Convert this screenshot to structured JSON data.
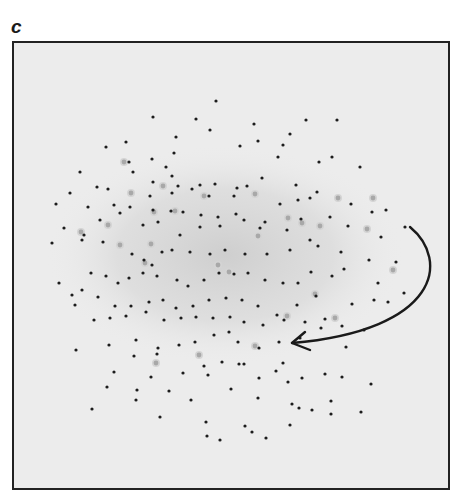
{
  "figure": {
    "panel_label": "c",
    "frame": {
      "x": 12,
      "y": 41,
      "width": 438,
      "height": 449
    },
    "colors": {
      "background": "#ececec",
      "frame": "#222222",
      "dot": "#1c1c1c",
      "faint_spot": "#9a9a9a",
      "halo": "#d4d4d4",
      "arrow": "#1a1a1a"
    },
    "arrow": {
      "description": "curved arrow from right edge of dot cloud sweeping down-left",
      "start": [
        410,
        227
      ],
      "control1": [
        450,
        260
      ],
      "control2": [
        440,
        330
      ],
      "end": [
        292,
        343
      ],
      "head": [
        [
          305,
          332
        ],
        [
          292,
          343
        ],
        [
          310,
          350
        ]
      ]
    }
  },
  "chart_data": {
    "type": "scatter",
    "title": "",
    "panel": "c",
    "xlabel": "",
    "ylabel": "",
    "grid": false,
    "legend": null,
    "annotations": [
      "curved arrow indicating rotation direction around cloud edge, ending near (292,343)"
    ],
    "series": [
      {
        "name": "dark-dots",
        "points": [
          [
            216,
            101
          ],
          [
            153,
            117
          ],
          [
            196,
            119
          ],
          [
            254,
            124
          ],
          [
            306,
            120
          ],
          [
            337,
            120
          ],
          [
            106,
            147
          ],
          [
            126,
            142
          ],
          [
            176,
            137
          ],
          [
            210,
            130
          ],
          [
            240,
            146
          ],
          [
            258,
            141
          ],
          [
            283,
            145
          ],
          [
            80,
            172
          ],
          [
            129,
            162
          ],
          [
            152,
            159
          ],
          [
            166,
            167
          ],
          [
            174,
            153
          ],
          [
            278,
            157
          ],
          [
            290,
            134
          ],
          [
            319,
            162
          ],
          [
            332,
            157
          ],
          [
            360,
            167
          ],
          [
            97,
            187
          ],
          [
            108,
            189
          ],
          [
            133,
            172
          ],
          [
            153,
            182
          ],
          [
            172,
            176
          ],
          [
            178,
            186
          ],
          [
            200,
            185
          ],
          [
            215,
            184
          ],
          [
            237,
            188
          ],
          [
            247,
            186
          ],
          [
            296,
            185
          ],
          [
            317,
            192
          ],
          [
            70,
            193
          ],
          [
            114,
            205
          ],
          [
            150,
            196
          ],
          [
            172,
            193
          ],
          [
            192,
            189
          ],
          [
            209,
            196
          ],
          [
            234,
            196
          ],
          [
            262,
            178
          ],
          [
            280,
            204
          ],
          [
            298,
            200
          ],
          [
            310,
            198
          ],
          [
            351,
            204
          ],
          [
            386,
            210
          ],
          [
            56,
            204
          ],
          [
            88,
            207
          ],
          [
            130,
            207
          ],
          [
            153,
            210
          ],
          [
            183,
            212
          ],
          [
            201,
            215
          ],
          [
            218,
            217
          ],
          [
            236,
            214
          ],
          [
            265,
            222
          ],
          [
            301,
            219
          ],
          [
            330,
            217
          ],
          [
            372,
            212
          ],
          [
            405,
            227
          ],
          [
            52,
            243
          ],
          [
            64,
            228
          ],
          [
            84,
            235
          ],
          [
            100,
            220
          ],
          [
            120,
            213
          ],
          [
            143,
            225
          ],
          [
            158,
            222
          ],
          [
            171,
            211
          ],
          [
            180,
            235
          ],
          [
            200,
            227
          ],
          [
            220,
            226
          ],
          [
            244,
            220
          ],
          [
            260,
            228
          ],
          [
            287,
            230
          ],
          [
            310,
            240
          ],
          [
            348,
            226
          ],
          [
            381,
            237
          ],
          [
            59,
            283
          ],
          [
            82,
            240
          ],
          [
            103,
            242
          ],
          [
            132,
            254
          ],
          [
            144,
            260
          ],
          [
            152,
            265
          ],
          [
            162,
            252
          ],
          [
            172,
            250
          ],
          [
            190,
            252
          ],
          [
            210,
            254
          ],
          [
            225,
            250
          ],
          [
            245,
            254
          ],
          [
            267,
            254
          ],
          [
            290,
            250
          ],
          [
            318,
            246
          ],
          [
            341,
            252
          ],
          [
            369,
            260
          ],
          [
            72,
            295
          ],
          [
            91,
            273
          ],
          [
            106,
            276
          ],
          [
            118,
            283
          ],
          [
            129,
            278
          ],
          [
            143,
            273
          ],
          [
            157,
            276
          ],
          [
            177,
            280
          ],
          [
            188,
            286
          ],
          [
            204,
            280
          ],
          [
            219,
            273
          ],
          [
            234,
            274
          ],
          [
            248,
            273
          ],
          [
            265,
            280
          ],
          [
            283,
            283
          ],
          [
            298,
            283
          ],
          [
            311,
            272
          ],
          [
            332,
            276
          ],
          [
            344,
            269
          ],
          [
            378,
            283
          ],
          [
            396,
            262
          ],
          [
            404,
            293
          ],
          [
            75,
            305
          ],
          [
            82,
            290
          ],
          [
            98,
            297
          ],
          [
            115,
            306
          ],
          [
            131,
            306
          ],
          [
            149,
            302
          ],
          [
            163,
            300
          ],
          [
            176,
            308
          ],
          [
            193,
            306
          ],
          [
            209,
            300
          ],
          [
            226,
            298
          ],
          [
            242,
            300
          ],
          [
            258,
            306
          ],
          [
            277,
            315
          ],
          [
            297,
            305
          ],
          [
            316,
            296
          ],
          [
            352,
            304
          ],
          [
            374,
            300
          ],
          [
            388,
            302
          ],
          [
            94,
            320
          ],
          [
            110,
            318
          ],
          [
            126,
            316
          ],
          [
            146,
            312
          ],
          [
            164,
            320
          ],
          [
            181,
            318
          ],
          [
            196,
            317
          ],
          [
            213,
            318
          ],
          [
            230,
            317
          ],
          [
            244,
            322
          ],
          [
            263,
            325
          ],
          [
            284,
            320
          ],
          [
            305,
            322
          ],
          [
            325,
            319
          ],
          [
            342,
            326
          ],
          [
            364,
            330
          ],
          [
            76,
            350
          ],
          [
            109,
            345
          ],
          [
            136,
            340
          ],
          [
            158,
            348
          ],
          [
            179,
            345
          ],
          [
            195,
            342
          ],
          [
            214,
            335
          ],
          [
            229,
            332
          ],
          [
            238,
            342
          ],
          [
            259,
            348
          ],
          [
            279,
            342
          ],
          [
            321,
            328
          ],
          [
            134,
            356
          ],
          [
            157,
            354
          ],
          [
            204,
            366
          ],
          [
            222,
            362
          ],
          [
            239,
            364
          ],
          [
            283,
            363
          ],
          [
            300,
            338
          ],
          [
            346,
            347
          ],
          [
            114,
            372
          ],
          [
            151,
            377
          ],
          [
            183,
            373
          ],
          [
            208,
            375
          ],
          [
            231,
            389
          ],
          [
            244,
            364
          ],
          [
            259,
            378
          ],
          [
            276,
            371
          ],
          [
            288,
            382
          ],
          [
            302,
            378
          ],
          [
            342,
            377
          ],
          [
            137,
            390
          ],
          [
            169,
            391
          ],
          [
            258,
            398
          ],
          [
            331,
            401
          ],
          [
            136,
            400
          ],
          [
            191,
            400
          ],
          [
            292,
            404
          ],
          [
            325,
            374
          ],
          [
            371,
            384
          ],
          [
            160,
            417
          ],
          [
            206,
            422
          ],
          [
            245,
            426
          ],
          [
            266,
            438
          ],
          [
            220,
            440
          ],
          [
            299,
            408
          ],
          [
            312,
            410
          ],
          [
            290,
            425
          ],
          [
            92,
            409
          ],
          [
            107,
            387
          ],
          [
            207,
            436
          ],
          [
            252,
            432
          ],
          [
            331,
            414
          ],
          [
            361,
            412
          ]
        ]
      },
      {
        "name": "faint-spots",
        "points": [
          [
            124,
            162
          ],
          [
            131,
            193
          ],
          [
            163,
            186
          ],
          [
            154,
            212
          ],
          [
            175,
            211
          ],
          [
            204,
            196
          ],
          [
            255,
            194
          ],
          [
            288,
            218
          ],
          [
            320,
            226
          ],
          [
            338,
            198
          ],
          [
            373,
            198
          ],
          [
            81,
            232
          ],
          [
            108,
            225
          ],
          [
            120,
            245
          ],
          [
            151,
            244
          ],
          [
            145,
            263
          ],
          [
            229,
            272
          ],
          [
            287,
            316
          ],
          [
            367,
            229
          ],
          [
            393,
            270
          ],
          [
            315,
            294
          ],
          [
            258,
            236
          ],
          [
            218,
            265
          ],
          [
            335,
            318
          ],
          [
            199,
            355
          ],
          [
            156,
            363
          ],
          [
            255,
            346
          ],
          [
            302,
            223
          ]
        ]
      }
    ]
  }
}
